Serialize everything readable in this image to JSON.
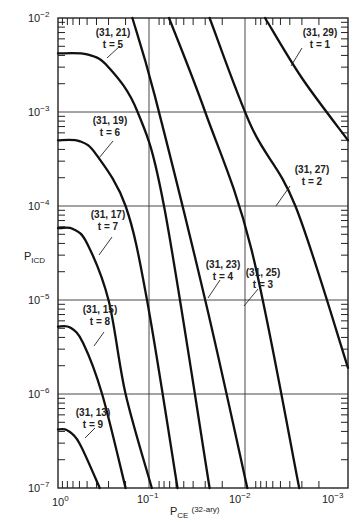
{
  "chart_data": {
    "type": "line",
    "title": "",
    "xlabel": "P_CE (32-ary)",
    "ylabel": "P_ICD",
    "xscale": "log",
    "yscale": "log",
    "xlim": [
      1,
      0.001
    ],
    "ylim": [
      1e-07,
      0.01
    ],
    "x_reversed": true,
    "grid": {
      "x": [
        0.1,
        0.01
      ],
      "y": [
        0.001,
        0.0001,
        1e-05,
        1e-06
      ]
    },
    "x_tick_labels": [
      "10^0",
      "10^-1",
      "10^-2",
      "10^-3"
    ],
    "y_tick_labels": [
      "10^-2",
      "10^-3",
      "10^-4",
      "10^-5",
      "10^-6",
      "10^-7"
    ],
    "legend": null,
    "series": [
      {
        "name": "(31, 29) t = 1",
        "code": "(31, 29)",
        "t": 1,
        "points": [
          [
            0.0072,
            0.01
          ],
          [
            0.003,
            0.0023
          ],
          [
            0.001,
            0.0005
          ]
        ]
      },
      {
        "name": "(31, 27) t = 2",
        "code": "(31, 27)",
        "t": 2,
        "points": [
          [
            0.027,
            0.01
          ],
          [
            0.01,
            0.0007
          ],
          [
            0.0035,
            0.0001
          ],
          [
            0.001,
            1.9e-06
          ]
        ]
      },
      {
        "name": "(31, 25) t = 3",
        "code": "(31, 25)",
        "t": 3,
        "points": [
          [
            0.071,
            0.01
          ],
          [
            0.03,
            0.001
          ],
          [
            0.01,
            3.5e-05
          ],
          [
            0.0032,
            1e-07
          ]
        ]
      },
      {
        "name": "(31, 23) t = 4",
        "code": "(31, 23)",
        "t": 4,
        "points": [
          [
            0.17,
            0.01
          ],
          [
            0.1,
            0.0015
          ],
          [
            0.03,
            1e-05
          ],
          [
            0.011,
            1e-07
          ]
        ]
      },
      {
        "name": "(31, 21) t = 5",
        "code": "(31, 21)",
        "t": 5,
        "points": [
          [
            1.0,
            0.0042
          ],
          [
            0.5,
            0.0041
          ],
          [
            0.3,
            0.003
          ],
          [
            0.15,
            0.001
          ],
          [
            0.08,
            0.0001
          ],
          [
            0.027,
            1e-07
          ]
        ]
      },
      {
        "name": "(31, 19) t = 6",
        "code": "(31, 19)",
        "t": 6,
        "points": [
          [
            1.0,
            0.0005
          ],
          [
            0.6,
            0.00049
          ],
          [
            0.4,
            0.00035
          ],
          [
            0.2,
            0.0001
          ],
          [
            0.12,
            1e-05
          ],
          [
            0.058,
            1e-07
          ]
        ]
      },
      {
        "name": "(31, 17) t = 7",
        "code": "(31, 17)",
        "t": 7,
        "points": [
          [
            1.0,
            5.8e-05
          ],
          [
            0.7,
            5.7e-05
          ],
          [
            0.5,
            4e-05
          ],
          [
            0.3,
            1e-05
          ],
          [
            0.2,
            1e-06
          ],
          [
            0.107,
            1e-07
          ]
        ]
      },
      {
        "name": "(31, 15) t = 8",
        "code": "(31, 15)",
        "t": 8,
        "points": [
          [
            1.0,
            5.2e-06
          ],
          [
            0.75,
            5.1e-06
          ],
          [
            0.55,
            3.5e-06
          ],
          [
            0.35,
            1e-06
          ],
          [
            0.2,
            1e-07
          ]
        ]
      },
      {
        "name": "(31, 13) t = 9",
        "code": "(31, 13)",
        "t": 9,
        "points": [
          [
            1.0,
            4.2e-07
          ],
          [
            0.8,
            4.1e-07
          ],
          [
            0.6,
            3e-07
          ],
          [
            0.37,
            1e-07
          ]
        ]
      }
    ]
  },
  "axes": {
    "y_label_main": "P",
    "y_label_sub": "ICD",
    "x_label_main": "P",
    "x_label_sub": "CE",
    "x_label_suffix": "(32-ary)",
    "x_ticks": [
      {
        "base": "10",
        "exp": "0"
      },
      {
        "base": "10",
        "exp": "−1"
      },
      {
        "base": "10",
        "exp": "−2"
      },
      {
        "base": "10",
        "exp": "−3"
      }
    ],
    "y_ticks": [
      {
        "base": "10",
        "exp": "−2"
      },
      {
        "base": "10",
        "exp": "−3"
      },
      {
        "base": "10",
        "exp": "−4"
      },
      {
        "base": "10",
        "exp": "−5"
      },
      {
        "base": "10",
        "exp": "−6"
      },
      {
        "base": "10",
        "exp": "−7"
      }
    ]
  },
  "labels": [
    {
      "code": "(31, 29)",
      "t": "t = 1"
    },
    {
      "code": "(31, 27)",
      "t": "t = 2"
    },
    {
      "code": "(31, 25)",
      "t": "t = 3"
    },
    {
      "code": "(31, 23)",
      "t": "t = 4"
    },
    {
      "code": "(31, 21)",
      "t": "t = 5"
    },
    {
      "code": "(31, 19)",
      "t": "t = 6"
    },
    {
      "code": "(31, 17)",
      "t": "t = 7"
    },
    {
      "code": "(31, 15)",
      "t": "t = 8"
    },
    {
      "code": "(31, 13)",
      "t": "t = 9"
    }
  ]
}
